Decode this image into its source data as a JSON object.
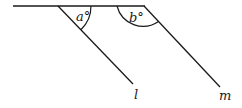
{
  "diagram": {
    "type": "geometry-angles",
    "angle_labels": {
      "a": "a°",
      "b": "b°"
    },
    "line_labels": {
      "l": "l",
      "m": "m"
    },
    "stroke_color": "#1a1a1a"
  }
}
